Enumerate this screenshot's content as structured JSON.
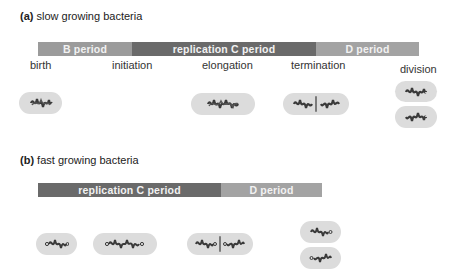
{
  "panel_a": {
    "label": "(a)",
    "title": "slow growing bacteria",
    "bars": [
      {
        "name": "B period",
        "color": "#9b9b9b"
      },
      {
        "name": "replication C period",
        "color": "#6a6a6a"
      },
      {
        "name": "D period",
        "color": "#a3a3a3"
      }
    ],
    "stages": [
      "birth",
      "initiation",
      "elongation",
      "termination",
      "division"
    ],
    "cells": [
      {
        "stage": "birth",
        "chromosomes": 1
      },
      {
        "stage": "elongation",
        "chromosomes": 1,
        "replicating": true
      },
      {
        "stage": "termination",
        "chromosomes": 2,
        "septum": true
      },
      {
        "stage": "division",
        "daughter_cells": 2
      }
    ]
  },
  "panel_b": {
    "label": "(b)",
    "title": "fast growing bacteria",
    "bars": [
      {
        "name": "replication C period",
        "color": "#6a6a6a"
      },
      {
        "name": "D period",
        "color": "#a3a3a3"
      }
    ],
    "cells": [
      {
        "stage": "birth",
        "chromosomes": 1,
        "replicating": true
      },
      {
        "stage": "elongation",
        "chromosomes": 1,
        "replicating": true
      },
      {
        "stage": "termination",
        "chromosomes": 2,
        "septum": true
      },
      {
        "stage": "division",
        "daughter_cells": 2
      }
    ]
  },
  "colors": {
    "cell_fill": "#dcdcdc",
    "chromosome": "#3a3a3a",
    "septum": "#7a7a7a"
  }
}
